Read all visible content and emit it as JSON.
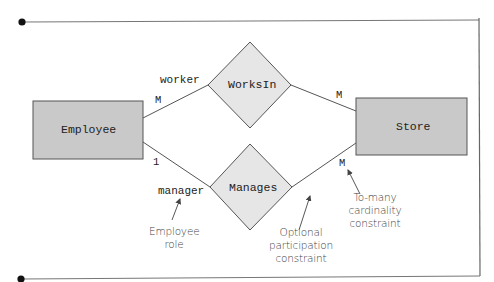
{
  "diagram": {
    "type": "entity-relationship",
    "colors": {
      "entity_fill": "#c9c9c9",
      "relationship_fill": "#e6e6e6",
      "stroke": "#555555",
      "frame": "#666666",
      "text": "#222222",
      "annotation_text": "#444444"
    },
    "entities": [
      {
        "id": "employee",
        "label": "Employee"
      },
      {
        "id": "store",
        "label": "Store"
      }
    ],
    "relationships": [
      {
        "id": "worksin",
        "label": "WorksIn"
      },
      {
        "id": "manages",
        "label": "Manages"
      }
    ],
    "connections": [
      {
        "from": "employee",
        "to": "worksin",
        "role": "worker",
        "cardinality": "M"
      },
      {
        "from": "worksin",
        "to": "store",
        "cardinality": "M"
      },
      {
        "from": "employee",
        "to": "manages",
        "role": "manager",
        "cardinality": "1"
      },
      {
        "from": "manages",
        "to": "store",
        "cardinality": "M"
      }
    ],
    "annotations": [
      {
        "id": "employee-role",
        "lines": [
          "Employee",
          "role"
        ]
      },
      {
        "id": "optional-participation",
        "lines": [
          "Optional",
          "participation",
          "constraint"
        ]
      },
      {
        "id": "to-many-cardinality",
        "lines": [
          "To-many",
          "cardinality",
          "constraint"
        ]
      }
    ]
  }
}
